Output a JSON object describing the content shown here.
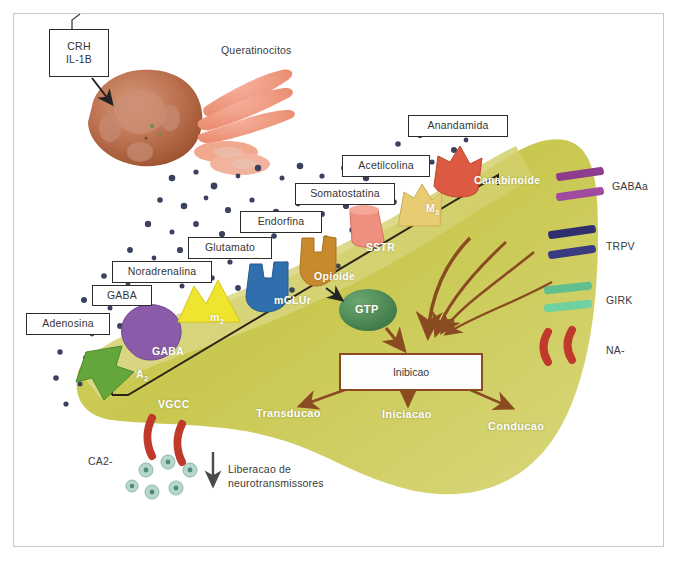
{
  "figure": {
    "language": "pt-BR"
  },
  "cells": {
    "macrophage_label": "",
    "keratinocyte_label": "Queratinocitos"
  },
  "stimulus_box": {
    "line1": "CRH",
    "line2": "IL-1B"
  },
  "mediator_boxes": [
    {
      "label": "Adenosina",
      "x": 26,
      "y": 313,
      "w": 84,
      "h": 22
    },
    {
      "label": "GABA",
      "x": 92,
      "y": 285,
      "w": 60,
      "h": 21
    },
    {
      "label": "Noradrenalina",
      "x": 112,
      "y": 261,
      "w": 100,
      "h": 22
    },
    {
      "label": "Glutamato",
      "x": 188,
      "y": 237,
      "w": 84,
      "h": 22
    },
    {
      "label": "Endorfina",
      "x": 240,
      "y": 211,
      "w": 82,
      "h": 22
    },
    {
      "label": "Somatostatina",
      "x": 295,
      "y": 183,
      "w": 100,
      "h": 22
    },
    {
      "label": "Acetilcolina",
      "x": 342,
      "y": 155,
      "w": 88,
      "h": 22
    },
    {
      "label": "Anandamida",
      "x": 408,
      "y": 115,
      "w": 100,
      "h": 22
    }
  ],
  "receptors": [
    {
      "name": "A",
      "sub": "2",
      "color": "#63a63c",
      "x": 136,
      "y": 371
    },
    {
      "name": "GABA",
      "sub": "",
      "color": "#8a5ba8",
      "x": 152,
      "y": 347
    },
    {
      "name": "m",
      "sub": "2",
      "color": "#efe52e",
      "x": 210,
      "y": 312
    },
    {
      "name": "mGLUr",
      "sub": "",
      "color": "#2f6fae",
      "x": 274,
      "y": 296
    },
    {
      "name": "Opioide",
      "sub": "",
      "color": "#c98a2e",
      "x": 316,
      "y": 272
    },
    {
      "name": "SSTR",
      "sub": "",
      "color": "#ef8f7e",
      "x": 366,
      "y": 243
    },
    {
      "name": "M",
      "sub": "3",
      "color": "#e8cc73",
      "x": 428,
      "y": 207
    },
    {
      "name": "Canabinoide",
      "sub": "",
      "color": "#dd5a42",
      "x": 478,
      "y": 178
    }
  ],
  "ion_channels": [
    {
      "label": "GABAa",
      "color": "#8e3c8e",
      "x": 612,
      "y": 185
    },
    {
      "label": "TRPV",
      "color": "#2f2f70",
      "x": 606,
      "y": 243
    },
    {
      "label": "GIRK",
      "color": "#5fbf8f",
      "x": 606,
      "y": 297
    },
    {
      "label": "NA-",
      "color": "#c0392b",
      "x": 606,
      "y": 349
    }
  ],
  "signaling": {
    "gtp_label": "GTP",
    "gtp_color": "#4e8b55",
    "inhibition_label": "Inibicao",
    "vgcc_label": "VGCC",
    "calcium_label": "CA2-"
  },
  "outputs": [
    {
      "label": "Transducao",
      "x": 256,
      "y": 407
    },
    {
      "label": "Iniciacao",
      "x": 388,
      "y": 408
    },
    {
      "label": "Conducao",
      "x": 490,
      "y": 420
    }
  ],
  "release": {
    "line1": "Liberacao de",
    "line2": "neurotransmissores"
  },
  "colors": {
    "neuron_body": "#c8c850",
    "membrane_band": "#d8d77e",
    "arrow_brown": "#8a4a22",
    "frame": "#c9c9c9"
  }
}
